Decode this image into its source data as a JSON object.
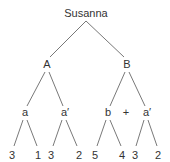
{
  "diagram": {
    "type": "tree",
    "root": {
      "id": "root",
      "label": "Susanna",
      "x": 86,
      "y": 17
    },
    "nodes": [
      {
        "id": "A",
        "label": "A",
        "x": 47,
        "y": 68
      },
      {
        "id": "B",
        "label": "B",
        "x": 127,
        "y": 68
      },
      {
        "id": "a1",
        "label": "a",
        "x": 25,
        "y": 116
      },
      {
        "id": "ap1",
        "label": "a′",
        "x": 65,
        "y": 116
      },
      {
        "id": "b",
        "label": "b",
        "x": 108,
        "y": 116
      },
      {
        "id": "ap2",
        "label": "a′",
        "x": 147,
        "y": 116
      },
      {
        "id": "l1",
        "label": "3",
        "x": 12,
        "y": 159
      },
      {
        "id": "l2",
        "label": "1",
        "x": 38,
        "y": 159
      },
      {
        "id": "l3",
        "label": "3",
        "x": 51,
        "y": 159
      },
      {
        "id": "l4",
        "label": "2",
        "x": 79,
        "y": 159
      },
      {
        "id": "l5",
        "label": "5",
        "x": 95,
        "y": 159
      },
      {
        "id": "l6",
        "label": "4",
        "x": 122,
        "y": 159
      },
      {
        "id": "l7",
        "label": "3",
        "x": 135,
        "y": 159
      },
      {
        "id": "l8",
        "label": "2",
        "x": 158,
        "y": 159
      }
    ],
    "operator": {
      "label": "+",
      "x": 126,
      "y": 116
    },
    "edges": [
      {
        "from": "root",
        "to": "A",
        "x1": 86,
        "y1": 21,
        "x2": 50,
        "y2": 57
      },
      {
        "from": "root",
        "to": "B",
        "x1": 86,
        "y1": 21,
        "x2": 124,
        "y2": 57
      },
      {
        "from": "A",
        "to": "a1",
        "x1": 45,
        "y1": 72,
        "x2": 27,
        "y2": 106
      },
      {
        "from": "A",
        "to": "ap1",
        "x1": 49,
        "y1": 72,
        "x2": 63,
        "y2": 106
      },
      {
        "from": "B",
        "to": "b",
        "x1": 125,
        "y1": 72,
        "x2": 110,
        "y2": 106
      },
      {
        "from": "B",
        "to": "ap2",
        "x1": 129,
        "y1": 72,
        "x2": 145,
        "y2": 106
      },
      {
        "from": "a1",
        "to": "l1",
        "x1": 23,
        "y1": 120,
        "x2": 14,
        "y2": 146
      },
      {
        "from": "a1",
        "to": "l2",
        "x1": 27,
        "y1": 120,
        "x2": 37,
        "y2": 146
      },
      {
        "from": "ap1",
        "to": "l3",
        "x1": 62,
        "y1": 120,
        "x2": 53,
        "y2": 146
      },
      {
        "from": "ap1",
        "to": "l4",
        "x1": 66,
        "y1": 120,
        "x2": 77,
        "y2": 146
      },
      {
        "from": "b",
        "to": "l5",
        "x1": 106,
        "y1": 120,
        "x2": 97,
        "y2": 146
      },
      {
        "from": "b",
        "to": "l6",
        "x1": 110,
        "y1": 120,
        "x2": 121,
        "y2": 146
      },
      {
        "from": "ap2",
        "to": "l7",
        "x1": 144,
        "y1": 120,
        "x2": 136,
        "y2": 146
      },
      {
        "from": "ap2",
        "to": "l8",
        "x1": 148,
        "y1": 120,
        "x2": 157,
        "y2": 146
      }
    ]
  }
}
